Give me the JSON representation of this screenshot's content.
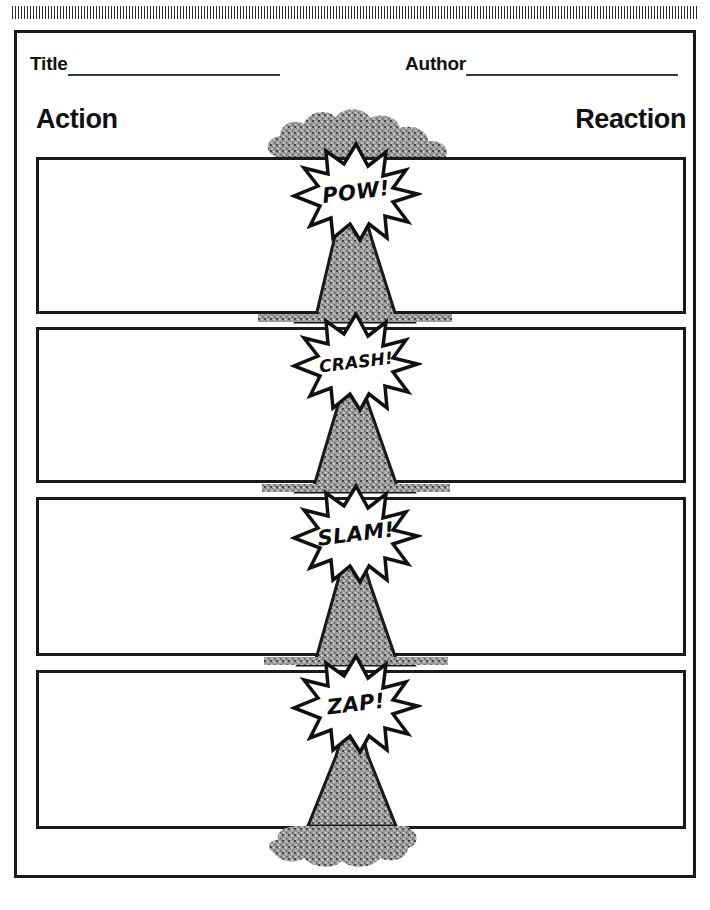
{
  "worksheet": {
    "decor": {
      "top_hatch": "hatched-rule",
      "ink_color": "#1a1a1a",
      "texture_color": "#8c8c8c"
    },
    "meta": {
      "title": {
        "label": "Title",
        "value": "",
        "placeholder": ""
      },
      "author": {
        "label": "Author",
        "value": "",
        "placeholder": ""
      }
    },
    "columns": {
      "left": "Action",
      "right": "Reaction"
    },
    "rows": [
      {
        "id": 1,
        "burst": "POW!",
        "action": "",
        "reaction": ""
      },
      {
        "id": 2,
        "burst": "CRASH!",
        "action": "",
        "reaction": ""
      },
      {
        "id": 3,
        "burst": "SLAM!",
        "action": "",
        "reaction": ""
      },
      {
        "id": 4,
        "burst": "ZAP!",
        "action": "",
        "reaction": ""
      }
    ]
  }
}
